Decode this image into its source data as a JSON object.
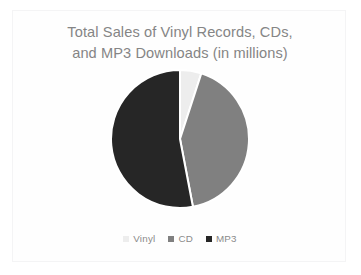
{
  "chart_data": {
    "type": "pie",
    "title": "Total Sales of Vinyl Records, CDs,\nand MP3 Downloads (in millions)",
    "title_line1": "Total Sales of Vinyl Records, CDs,",
    "title_line2": "and MP3 Downloads (in millions)",
    "xlabel": "",
    "ylabel": "",
    "grid": false,
    "legend_position": "bottom",
    "start_angle_deg": 0,
    "direction": "clockwise",
    "categories": [
      "Vinyl",
      "CD",
      "MP3"
    ],
    "values": [
      5,
      42,
      53
    ],
    "unit": "millions",
    "slices": [
      {
        "label": "Vinyl",
        "value": 5,
        "percent": 5,
        "color": "#ededed",
        "start_deg": 0,
        "end_deg": 18
      },
      {
        "label": "CD",
        "value": 42,
        "percent": 42,
        "color": "#808080",
        "start_deg": 18,
        "end_deg": 169
      },
      {
        "label": "MP3",
        "value": 53,
        "percent": 53,
        "color": "#262626",
        "start_deg": 169,
        "end_deg": 360
      }
    ],
    "legend": [
      {
        "label": "Vinyl",
        "color": "#ededed"
      },
      {
        "label": "CD",
        "color": "#808080"
      },
      {
        "label": "MP3",
        "color": "#262626"
      }
    ],
    "colors": {
      "vinyl": "#ededed",
      "cd": "#808080",
      "mp3": "#262626",
      "title_text": "#858585",
      "legend_text": "#8a8a8a",
      "card_border": "#f4f4f5",
      "background": "#ffffff"
    }
  }
}
